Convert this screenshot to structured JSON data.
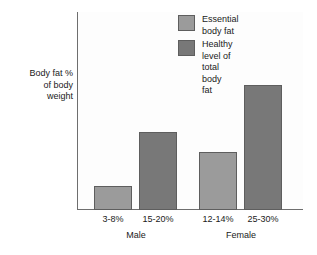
{
  "chart_data": {
    "type": "bar",
    "title": "",
    "subtitle": "",
    "xlabel": "",
    "ylabel": "Body fat %\nof body\nweight",
    "grid": false,
    "legend_position": "top-right",
    "ylim": [
      0,
      40
    ],
    "categories": [
      "3-8%",
      "15-20%",
      "12-14%",
      "25-30%"
    ],
    "groups": [
      "Male",
      "Female"
    ],
    "series": [
      {
        "name": "Essential body fat",
        "color": "#9b9b9b",
        "values": [
          5,
          null,
          13,
          null
        ]
      },
      {
        "name": "Healthy level of\ntotal body fat",
        "color": "#787878",
        "values": [
          null,
          17.5,
          null,
          27.5
        ]
      }
    ],
    "bars": [
      {
        "label": "3-8%",
        "group": "Male",
        "series": "Essential body fat",
        "value": 5,
        "color": "#9b9b9b"
      },
      {
        "label": "15-20%",
        "group": "Male",
        "series": "Healthy level of total body fat",
        "value": 17.5,
        "color": "#787878"
      },
      {
        "label": "12-14%",
        "group": "Female",
        "series": "Essential body fat",
        "value": 13,
        "color": "#9b9b9b"
      },
      {
        "label": "25-30%",
        "group": "Female",
        "series": "Healthy level of total body fat",
        "value": 27.5,
        "color": "#787878"
      }
    ]
  },
  "axes": {
    "y_title": "Body fat %\nof body\nweight",
    "axis_color": "#6e6e6e"
  },
  "ticks": {
    "labels": [
      "3-8%",
      "15-20%",
      "12-14%",
      "25-30%"
    ]
  },
  "groups": {
    "labels": [
      "Male",
      "Female"
    ]
  },
  "legend": {
    "entries": [
      {
        "label": "Essential body fat",
        "color": "#9b9b9b"
      },
      {
        "label": "Healthy level of\ntotal body fat",
        "color": "#787878"
      }
    ]
  }
}
